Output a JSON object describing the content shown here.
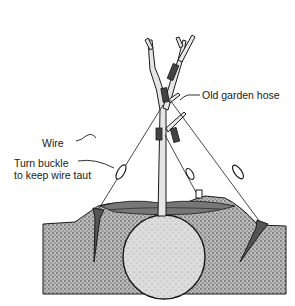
{
  "figure": {
    "labels": {
      "hose": "Old garden hose",
      "wire": "Wire",
      "buckle_line1": "Turn buckle",
      "buckle_line2": "to keep wire taut"
    },
    "colors": {
      "ink": "#1a1a1a",
      "soil": "#9a9a9a",
      "rootball": "#d6d6d6",
      "trunk": "#e6e6e6",
      "background": "#ffffff"
    }
  }
}
